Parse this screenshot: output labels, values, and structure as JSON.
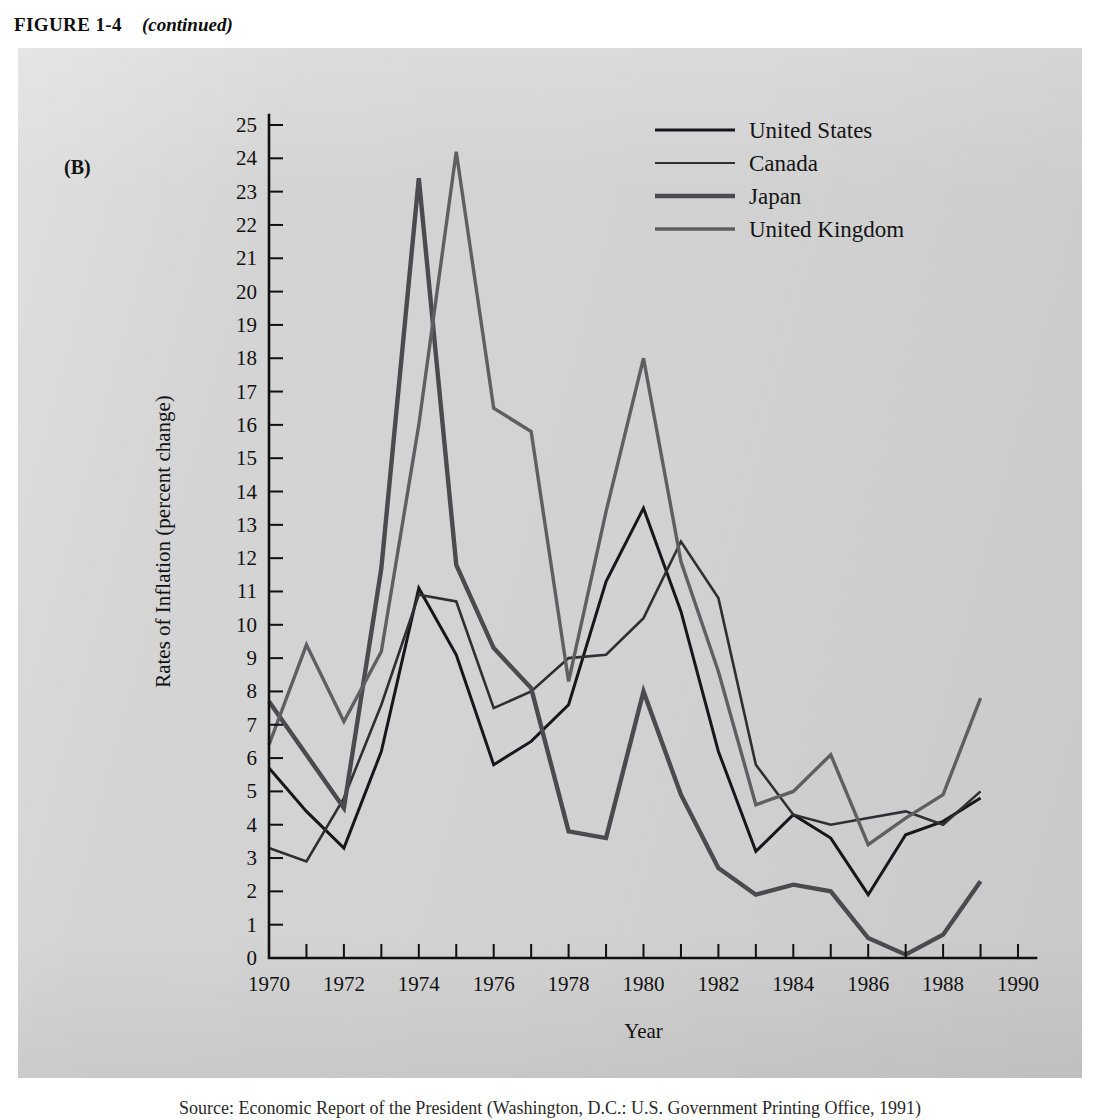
{
  "figure": {
    "label": "FIGURE 1-4",
    "continued": "(continued)",
    "panel_letter": "(B)",
    "caption": "Source: Economic Report of the President (Washington, D.C.: U.S. Government Printing Office, 1991)"
  },
  "chart_data": {
    "type": "line",
    "title": "",
    "xlabel": "Year",
    "ylabel": "Rates of Inflation (percent change)",
    "xlim": [
      1970,
      1990
    ],
    "ylim": [
      0,
      25
    ],
    "x_tick_step": 1,
    "x_label_step": 2,
    "y_tick_step": 1,
    "grid": false,
    "legend_position": "top-right",
    "x_tick_labels": [
      "1970",
      "1972",
      "1974",
      "1976",
      "1978",
      "1980",
      "1982",
      "1984",
      "1986",
      "1988",
      "1990"
    ],
    "y_tick_labels": [
      "0",
      "1",
      "2",
      "3",
      "4",
      "5",
      "6",
      "7",
      "8",
      "9",
      "10",
      "11",
      "12",
      "13",
      "14",
      "15",
      "16",
      "17",
      "18",
      "19",
      "20",
      "21",
      "22",
      "23",
      "24",
      "25"
    ],
    "x": [
      1970,
      1971,
      1972,
      1973,
      1974,
      1975,
      1976,
      1977,
      1978,
      1979,
      1980,
      1981,
      1982,
      1983,
      1984,
      1985,
      1986,
      1987,
      1988,
      1989
    ],
    "series": [
      {
        "name": "United States",
        "color": "#17171a",
        "width": 3.0,
        "dash": "",
        "values": [
          5.7,
          4.4,
          3.3,
          6.2,
          11.1,
          9.1,
          5.8,
          6.5,
          7.6,
          11.3,
          13.5,
          10.4,
          6.2,
          3.2,
          4.3,
          3.6,
          1.9,
          3.7,
          4.1,
          4.8
        ]
      },
      {
        "name": "Canada",
        "color": "#2e2e33",
        "width": 2.6,
        "dash": "",
        "values": [
          3.3,
          2.9,
          4.8,
          7.6,
          10.9,
          10.7,
          7.5,
          8.0,
          9.0,
          9.1,
          10.2,
          12.5,
          10.8,
          5.8,
          4.3,
          4.0,
          4.2,
          4.4,
          4.0,
          5.0
        ]
      },
      {
        "name": "Japan",
        "color": "#4a4a4f",
        "width": 4.4,
        "dash": "",
        "values": [
          7.7,
          6.1,
          4.5,
          11.7,
          23.4,
          11.8,
          9.3,
          8.1,
          3.8,
          3.6,
          8.0,
          4.9,
          2.7,
          1.9,
          2.2,
          2.0,
          0.6,
          0.1,
          0.7,
          2.3
        ]
      },
      {
        "name": "United Kingdom",
        "color": "#5f5f63",
        "width": 3.4,
        "dash": "",
        "values": [
          6.4,
          9.4,
          7.1,
          9.2,
          16.0,
          24.2,
          16.5,
          15.8,
          8.3,
          13.4,
          18.0,
          11.9,
          8.6,
          4.6,
          5.0,
          6.1,
          3.4,
          4.2,
          4.9,
          7.8
        ]
      }
    ],
    "legend": [
      {
        "label": "United States",
        "color": "#17171a",
        "width": 3.0
      },
      {
        "label": "Canada",
        "color": "#2e2e33",
        "width": 2.2
      },
      {
        "label": "Japan",
        "color": "#4a4a4f",
        "width": 4.6
      },
      {
        "label": "United Kingdom",
        "color": "#5f5f63",
        "width": 3.6
      }
    ]
  }
}
